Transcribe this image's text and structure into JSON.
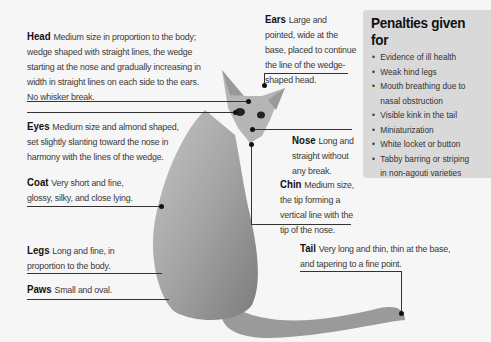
{
  "diagram": {
    "labels": {
      "head": {
        "term": "Head",
        "desc": "Medium size in proportion to the body; wedge shaped with straight lines, the wedge starting at the nose and gradually increasing in width in straight lines on each side to the ears. No whisker break."
      },
      "ears": {
        "term": "Ears",
        "desc": "Large and pointed, wide at the base, placed to continue the line of the wedge-shaped head."
      },
      "eyes": {
        "term": "Eyes",
        "desc": "Medium size and almond shaped, set slightly slanting toward the nose in harmony with the lines of the wedge."
      },
      "nose": {
        "term": "Nose",
        "desc": "Long and straight without any break."
      },
      "coat": {
        "term": "Coat",
        "desc": "Very short and fine, glossy, silky, and close lying."
      },
      "chin": {
        "term": "Chin",
        "desc": "Medium size, the tip forming a vertical line with the tip of the nose."
      },
      "legs": {
        "term": "Legs",
        "desc": "Long and fine, in proportion to the body."
      },
      "paws": {
        "term": "Paws",
        "desc": "Small and oval."
      },
      "tail": {
        "term": "Tail",
        "desc": "Very long and thin, thin at the base, and tapering to a fine point."
      }
    },
    "penalties": {
      "title": "Penalties given for",
      "items": [
        "Evidence of ill health",
        "Weak hind legs",
        "Mouth breathing due to nasal obstruction",
        "Visible kink in the tail",
        "Miniaturization",
        "White locket or button",
        "Tabby barring or striping in non-agouti varieties"
      ]
    },
    "colors": {
      "background": "#f6f6f6",
      "panel": "#d9d9d9",
      "line": "#333333",
      "cat": "#a8a8a8"
    }
  }
}
